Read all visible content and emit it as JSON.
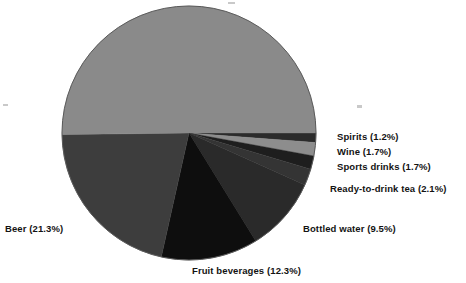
{
  "chart_data": {
    "type": "pie",
    "title": "",
    "subtitle": "",
    "xlabel": "",
    "ylabel": "",
    "legend_position": "callout-labels",
    "grid": false,
    "start_angle_deg": 0,
    "direction": "clockwise",
    "categories": [
      "Spirits",
      "Wine",
      "Sports drinks",
      "Ready-to-drink tea",
      "Bottled water",
      "Fruit beverages",
      "Beer",
      "Carbonated soft drinks"
    ],
    "values": [
      1.2,
      1.7,
      1.7,
      2.1,
      9.5,
      12.3,
      21.3,
      50.2
    ],
    "units": "percent",
    "slices": [
      {
        "name": "Spirits",
        "value": 1.2,
        "label": "Spirits (1.2%)",
        "color": "#2b2b2b",
        "start_deg": 0,
        "end_deg": 4.32,
        "labelled": true
      },
      {
        "name": "Wine",
        "value": 1.7,
        "label": "Wine (1.7%)",
        "color": "#8d8d8d",
        "start_deg": 4.32,
        "end_deg": 10.44,
        "labelled": true
      },
      {
        "name": "Sports drinks",
        "value": 1.7,
        "label": "Sports drinks (1.7%)",
        "color": "#1e1e1e",
        "start_deg": 10.44,
        "end_deg": 16.56,
        "labelled": true
      },
      {
        "name": "Ready-to-drink tea",
        "value": 2.1,
        "label": "Ready-to-drink tea (2.1%)",
        "color": "#343434",
        "start_deg": 16.56,
        "end_deg": 24.12,
        "labelled": true
      },
      {
        "name": "Bottled water",
        "value": 9.5,
        "label": "Bottled water (9.5%)",
        "color": "#2a2a2a",
        "start_deg": 24.12,
        "end_deg": 58.32,
        "labelled": true
      },
      {
        "name": "Fruit beverages",
        "value": 12.3,
        "label": "Fruit beverages (12.3%)",
        "color": "#0e0e0e",
        "start_deg": 58.32,
        "end_deg": 102.6,
        "labelled": true
      },
      {
        "name": "Beer",
        "value": 21.3,
        "label": "Beer (21.3%)",
        "color": "#3d3d3d",
        "start_deg": 102.6,
        "end_deg": 179.28,
        "labelled": true
      },
      {
        "name": "Carbonated soft drinks",
        "value": 50.2,
        "label": "",
        "color": "#8a8a8a",
        "start_deg": 179.28,
        "end_deg": 360,
        "labelled": false
      }
    ]
  },
  "geometry": {
    "center_x": 189,
    "center_y": 133,
    "radius": 127,
    "outline_color": "#5a5a5a"
  },
  "labels": {
    "spirits": "Spirits (1.2%)",
    "wine": "Wine (1.7%)",
    "sports_drinks": "Sports drinks (1.7%)",
    "ready_to_drink_tea": "Ready-to-drink tea (2.1%)",
    "bottled_water": "Bottled water (9.5%)",
    "fruit_beverages": "Fruit beverages (12.3%)",
    "beer": "Beer (21.3%)"
  },
  "colors": {
    "background": "#ffffff",
    "text": "#131313",
    "soft_drinks_slice": "#8a8a8a",
    "beer_slice": "#3d3d3d",
    "fruit_slice": "#0e0e0e",
    "water_slice": "#2a2a2a",
    "tea_slice": "#343434",
    "sports_slice": "#1e1e1e",
    "wine_slice": "#8d8d8d",
    "spirits_slice": "#2b2b2b"
  }
}
